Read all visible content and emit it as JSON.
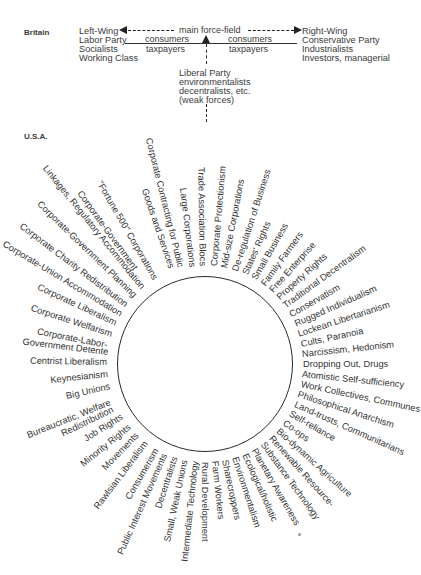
{
  "britain": {
    "country_label": "Britain",
    "left": [
      "Left-Wing",
      "Labor Party",
      "Socialists",
      "Working Class"
    ],
    "right": [
      "Right-Wing",
      "Conservative Party",
      "Industrialists",
      "Investors, managerial"
    ],
    "center_label": "main force-field",
    "left_under": [
      "consumers",
      "taxpayers"
    ],
    "right_under": [
      "consumers",
      "taxpayers"
    ],
    "middle": [
      "Liberal Party",
      "environmentalists",
      "decentralists, etc.",
      "(weak forces)"
    ]
  },
  "usa": {
    "country_label": "U.S.A.",
    "circle": {
      "cx": 205,
      "cy": 364,
      "r": 88
    },
    "labels": [
      {
        "text": "Corporate Contracting for Public",
        "angle": -104,
        "gap": 12
      },
      {
        "text": "Goods and Services",
        "angle": -109,
        "gap": 14
      },
      {
        "text": "Large Corporations",
        "angle": -97,
        "gap": 10
      },
      {
        "text": "Trade Association Blocs",
        "angle": -91,
        "gap": 10
      },
      {
        "text": "Corporate Protectionism",
        "angle": -85,
        "gap": 10
      },
      {
        "text": "Mid-size Corporations",
        "angle": -79,
        "gap": 10
      },
      {
        "text": "De-regulation of Business",
        "angle": -72,
        "gap": 10
      },
      {
        "text": "States' Rights",
        "angle": -66,
        "gap": 10
      },
      {
        "text": "Small Business",
        "angle": -60,
        "gap": 10
      },
      {
        "text": "Family Farmers",
        "angle": -54,
        "gap": 10
      },
      {
        "text": "Free Enterprise",
        "angle": -48,
        "gap": 10
      },
      {
        "text": "Property Rights",
        "angle": -42,
        "gap": 10
      },
      {
        "text": "Traditional Decentralism",
        "angle": -36,
        "gap": 10
      },
      {
        "text": "Conservatism",
        "angle": -30,
        "gap": 10
      },
      {
        "text": "Rugged Individualism",
        "angle": -24,
        "gap": 10
      },
      {
        "text": "Lockean Libertarianism",
        "angle": -18,
        "gap": 10
      },
      {
        "text": "Cults, Paranoia",
        "angle": -12,
        "gap": 10
      },
      {
        "text": "Narcissism, Hedonism",
        "angle": -6,
        "gap": 10
      },
      {
        "text": "Dropping Out, Drugs",
        "angle": 0,
        "gap": 10
      },
      {
        "text": "Atomistic Self-sufficiency",
        "angle": 6,
        "gap": 10
      },
      {
        "text": "Work Collectives, Communes",
        "angle": 12,
        "gap": 10
      },
      {
        "text": "Philosophical Anarchism",
        "angle": 18,
        "gap": 10
      },
      {
        "text": "Land-trusts, Communitarians",
        "angle": 24,
        "gap": 10
      },
      {
        "text": "Self-reliance",
        "angle": 30,
        "gap": 10
      },
      {
        "text": "Co-ops",
        "angle": 36,
        "gap": 10
      },
      {
        "text": "Bio-dynamic Agriculture",
        "angle": 42,
        "gap": 10
      },
      {
        "text": "Renewable Resource-",
        "angle": 48,
        "gap": 10
      },
      {
        "text": "Substance Technology",
        "angle": 54,
        "gap": 10
      },
      {
        "text": "Planetary Awareness",
        "angle": 60,
        "gap": 10
      },
      {
        "text": "Ecological/holistic",
        "angle": 66,
        "gap": 10
      },
      {
        "text": "Environmentalism",
        "angle": 72,
        "gap": 10
      },
      {
        "text": "Sharecroppers",
        "angle": 78,
        "gap": 10
      },
      {
        "text": "Farm Workers",
        "angle": 84,
        "gap": 10
      },
      {
        "text": "Rural Development",
        "angle": 90,
        "gap": 10
      },
      {
        "text": "Intermediate Technology",
        "angle": 96,
        "gap": 10
      },
      {
        "text": "Small, Weak Unions",
        "angle": 102,
        "gap": 10
      },
      {
        "text": "Decentralists",
        "angle": 108,
        "gap": 10
      },
      {
        "text": "Public Interest Movements",
        "angle": 114,
        "gap": 10
      },
      {
        "text": "Consumerism",
        "angle": 120,
        "gap": 10
      },
      {
        "text": "Rawlsian Liberalism",
        "angle": 127,
        "gap": 10
      },
      {
        "text": "Movements",
        "angle": 134,
        "gap": 10
      },
      {
        "text": "Minority Rights",
        "angle": 141,
        "gap": 10
      },
      {
        "text": "Job Rights",
        "angle": 148,
        "gap": 10
      },
      {
        "text": "Bureaucratic, Welfare",
        "angle": 158,
        "gap": 14
      },
      {
        "text": "Redistribution",
        "angle": 154,
        "gap": 14
      },
      {
        "text": "Big Unions",
        "angle": 167,
        "gap": 10
      },
      {
        "text": "Keynesianism",
        "angle": 174,
        "gap": 10
      },
      {
        "text": "Centrist Liberalism",
        "angle": 181,
        "gap": 10
      },
      {
        "text": "Government Detente",
        "angle": 187,
        "gap": 10
      },
      {
        "text": "Corporate-Labor-",
        "angle": 191,
        "gap": 12
      },
      {
        "text": "Corporate Welfarism",
        "angle": 198,
        "gap": 10
      },
      {
        "text": "Corporate Liberalism",
        "angle": 205,
        "gap": 10
      },
      {
        "text": "Corporate-Union Accommodation",
        "angle": 211,
        "gap": 10
      },
      {
        "text": "Corporate Charity Redistribution",
        "angle": 217,
        "gap": 10
      },
      {
        "text": "Corporate-Government Planning",
        "angle": 224,
        "gap": 10
      },
      {
        "text": "Linkages, Regulatory Accommodation",
        "angle": 231,
        "gap": 10
      },
      {
        "text": "Corporate-Government",
        "angle": 234,
        "gap": 30
      },
      {
        "text": "\"Fortune 500\" Corporations",
        "angle": 240,
        "gap": 10
      }
    ]
  }
}
